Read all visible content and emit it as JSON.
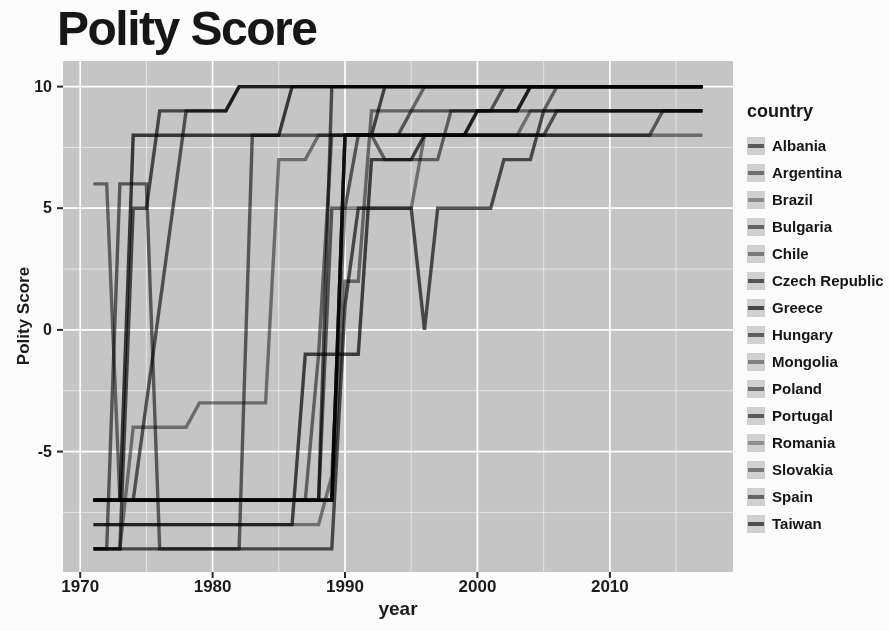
{
  "page": {
    "title": "Polity Score"
  },
  "colors": {
    "panel_bg": "#c5c5c5",
    "grid_major": "#ffffff",
    "grid_minor": "rgba(255,255,255,0.55)",
    "tick_mark": "#2b2b2b",
    "text": "#1b1b1b",
    "legend_key_bg": "#d0d0d0"
  },
  "axes": {
    "x_label": "year",
    "y_label": "Polity Score"
  },
  "legend": {
    "title": "country"
  },
  "chart_data": {
    "type": "line",
    "title": "Polity Score",
    "xlabel": "year",
    "ylabel": "Polity Score",
    "xlim": [
      1968.7,
      2019.3
    ],
    "ylim": [
      -9.95,
      11.05
    ],
    "x_ticks": [
      1970,
      1980,
      1990,
      2000,
      2010
    ],
    "y_ticks": [
      -5,
      0,
      5,
      10
    ],
    "grid": {
      "x_major": [
        1970,
        1980,
        1990,
        2000,
        2010
      ],
      "x_minor": [
        1975,
        1985,
        1995,
        2005,
        2015
      ],
      "y_major": [
        -5,
        0,
        5,
        10
      ],
      "y_minor": [
        -7.5,
        -2.5,
        2.5,
        7.5
      ]
    },
    "legend_position": "right",
    "series": [
      {
        "name": "Albania",
        "color": "#5a5a5a",
        "points": [
          [
            1971,
            -9
          ],
          [
            1989,
            -9
          ],
          [
            1990,
            1
          ],
          [
            1991,
            5
          ],
          [
            1995,
            5
          ],
          [
            1996,
            0
          ],
          [
            1997,
            5
          ],
          [
            2001,
            5
          ],
          [
            2002,
            7
          ],
          [
            2004,
            7
          ],
          [
            2005,
            9
          ],
          [
            2017,
            9
          ]
        ]
      },
      {
        "name": "Argentina",
        "color": "#6f6f6f",
        "points": [
          [
            1971,
            -9
          ],
          [
            1972,
            -9
          ],
          [
            1973,
            6
          ],
          [
            1975,
            6
          ],
          [
            1976,
            -9
          ],
          [
            1982,
            -9
          ],
          [
            1983,
            8
          ],
          [
            2013,
            8
          ],
          [
            2014,
            9
          ],
          [
            2017,
            9
          ]
        ]
      },
      {
        "name": "Brazil",
        "color": "#8a8a8a",
        "points": [
          [
            1971,
            -9
          ],
          [
            1973,
            -9
          ],
          [
            1974,
            -4
          ],
          [
            1978,
            -4
          ],
          [
            1979,
            -3
          ],
          [
            1984,
            -3
          ],
          [
            1985,
            7
          ],
          [
            1987,
            7
          ],
          [
            1988,
            8
          ],
          [
            2017,
            8
          ]
        ]
      },
      {
        "name": "Bulgaria",
        "color": "#636363",
        "points": [
          [
            1971,
            -7
          ],
          [
            1989,
            -7
          ],
          [
            1990,
            8
          ],
          [
            2005,
            8
          ],
          [
            2006,
            9
          ],
          [
            2017,
            9
          ]
        ]
      },
      {
        "name": "Chile",
        "color": "#7b7b7b",
        "points": [
          [
            1971,
            6
          ],
          [
            1972,
            6
          ],
          [
            1973,
            -7
          ],
          [
            1987,
            -7
          ],
          [
            1988,
            -1
          ],
          [
            1989,
            8
          ],
          [
            1999,
            8
          ],
          [
            2000,
            9
          ],
          [
            2005,
            9
          ],
          [
            2006,
            10
          ],
          [
            2017,
            10
          ]
        ]
      },
      {
        "name": "Czech Republic",
        "color": "#555555",
        "points": [
          [
            1971,
            -7
          ],
          [
            1989,
            -7
          ],
          [
            1990,
            8
          ],
          [
            1992,
            8
          ],
          [
            1993,
            10
          ],
          [
            2017,
            10
          ]
        ]
      },
      {
        "name": "Greece",
        "color": "#474747",
        "points": [
          [
            1971,
            -7
          ],
          [
            1973,
            -7
          ],
          [
            1974,
            8
          ],
          [
            1985,
            8
          ],
          [
            1986,
            10
          ],
          [
            2017,
            10
          ]
        ]
      },
      {
        "name": "Hungary",
        "color": "#606060",
        "points": [
          [
            1971,
            -7
          ],
          [
            1988,
            -7
          ],
          [
            1989,
            10
          ],
          [
            2017,
            10
          ]
        ]
      },
      {
        "name": "Mongolia",
        "color": "#818181",
        "points": [
          [
            1971,
            -7
          ],
          [
            1989,
            -7
          ],
          [
            1990,
            2
          ],
          [
            1991,
            2
          ],
          [
            1992,
            9
          ],
          [
            1995,
            9
          ],
          [
            1996,
            10
          ],
          [
            2017,
            10
          ]
        ]
      },
      {
        "name": "Poland",
        "color": "#6a6a6a",
        "points": [
          [
            1971,
            -7
          ],
          [
            1988,
            -7
          ],
          [
            1989,
            5
          ],
          [
            1990,
            5
          ],
          [
            1991,
            8
          ],
          [
            1994,
            8
          ],
          [
            1995,
            9
          ],
          [
            2001,
            9
          ],
          [
            2002,
            10
          ],
          [
            2017,
            10
          ]
        ]
      },
      {
        "name": "Portugal",
        "color": "#585858",
        "points": [
          [
            1971,
            -9
          ],
          [
            1973,
            -9
          ],
          [
            1974,
            5
          ],
          [
            1975,
            5
          ],
          [
            1976,
            9
          ],
          [
            1981,
            9
          ],
          [
            1982,
            10
          ],
          [
            2017,
            10
          ]
        ]
      },
      {
        "name": "Romania",
        "color": "#8e8e8e",
        "points": [
          [
            1971,
            -8
          ],
          [
            1988,
            -8
          ],
          [
            1989,
            -6
          ],
          [
            1990,
            5
          ],
          [
            1995,
            5
          ],
          [
            1996,
            8
          ],
          [
            2003,
            8
          ],
          [
            2004,
            9
          ],
          [
            2017,
            9
          ]
        ]
      },
      {
        "name": "Slovakia",
        "color": "#767676",
        "points": [
          [
            1971,
            -7
          ],
          [
            1989,
            -7
          ],
          [
            1990,
            8
          ],
          [
            1992,
            8
          ],
          [
            1993,
            7
          ],
          [
            1997,
            7
          ],
          [
            1998,
            9
          ],
          [
            2003,
            9
          ],
          [
            2004,
            10
          ],
          [
            2017,
            10
          ]
        ]
      },
      {
        "name": "Spain",
        "color": "#656565",
        "points": [
          [
            1971,
            -7
          ],
          [
            1974,
            -7
          ],
          [
            1975,
            -3
          ],
          [
            1976,
            1
          ],
          [
            1977,
            5
          ],
          [
            1978,
            9
          ],
          [
            1981,
            9
          ],
          [
            1982,
            10
          ],
          [
            2017,
            10
          ]
        ]
      },
      {
        "name": "Taiwan",
        "color": "#4f4f4f",
        "points": [
          [
            1971,
            -8
          ],
          [
            1986,
            -8
          ],
          [
            1987,
            -1
          ],
          [
            1991,
            -1
          ],
          [
            1992,
            7
          ],
          [
            1995,
            7
          ],
          [
            1996,
            8
          ],
          [
            1999,
            8
          ],
          [
            2000,
            9
          ],
          [
            2003,
            9
          ],
          [
            2004,
            10
          ],
          [
            2017,
            10
          ]
        ]
      }
    ]
  }
}
